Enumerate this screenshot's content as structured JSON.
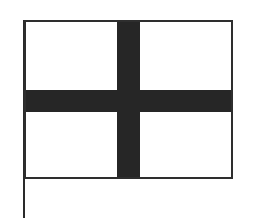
{
  "figure": {
    "pattern": "centered cross (dark cross on white field)",
    "colors": {
      "field": "#ffffff",
      "cross": "#262626",
      "outline": "#2e2e2e",
      "pole": "#2a2a2a"
    }
  }
}
